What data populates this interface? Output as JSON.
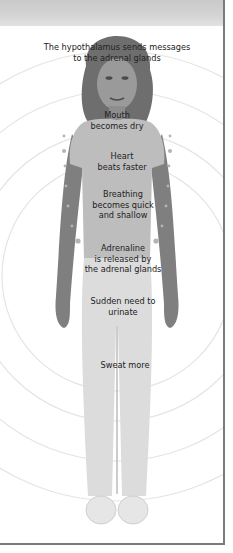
{
  "diagram": {
    "colors": {
      "header_band": "#d0d0d0",
      "frame": "#7a7a7a",
      "rings": "#e4e4e4",
      "text": "#222222",
      "marker_dots": "#b4b4b4"
    },
    "labels": [
      {
        "id": "hypothalamus",
        "line1": "The hypothalamus sends messages",
        "line2": "to the adrenal glands"
      },
      {
        "id": "mouth",
        "line1": "Mouth",
        "line2": "becomes dry"
      },
      {
        "id": "heart",
        "line1": "Heart",
        "line2": "beats faster"
      },
      {
        "id": "breathing",
        "line1": "Breathing",
        "line2": "becomes quick",
        "line3": "and shallow"
      },
      {
        "id": "adrenaline",
        "line1": "Adrenaline",
        "line2": "is released by",
        "line3": "the adrenal glands"
      },
      {
        "id": "urinate",
        "line1": "Sudden need to",
        "line2": "urinate"
      },
      {
        "id": "sweat",
        "line1": "Sweat more"
      }
    ]
  }
}
